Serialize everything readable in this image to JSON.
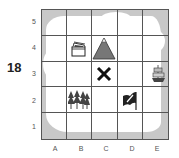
{
  "problem": {
    "number": "18"
  },
  "map": {
    "rows": [
      "5",
      "4",
      "3",
      "2",
      "1"
    ],
    "columns": [
      "A",
      "B",
      "C",
      "D",
      "E"
    ],
    "colors": {
      "water": "#c8c8c8",
      "land": "#ffffff",
      "grid": "#555555",
      "mountain": "#777777",
      "icon": "#222222"
    },
    "items": [
      {
        "name": "treasure-chest",
        "cell": "B4"
      },
      {
        "name": "mountain",
        "cell": "C4"
      },
      {
        "name": "x-mark",
        "cell": "C3"
      },
      {
        "name": "ship",
        "cell": "E3"
      },
      {
        "name": "forest",
        "cell": "B2"
      },
      {
        "name": "flag",
        "cell": "D2"
      }
    ]
  }
}
